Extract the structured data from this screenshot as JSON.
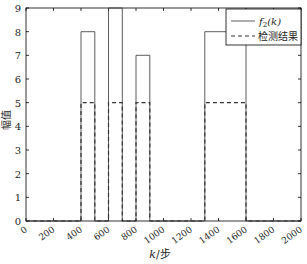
{
  "chart_data": {
    "type": "line",
    "title": "",
    "xlabel": "k/步",
    "ylabel": "幅值",
    "xlim": [
      0,
      2000
    ],
    "ylim": [
      0,
      9
    ],
    "xticks": [
      0,
      200,
      400,
      600,
      800,
      1000,
      1200,
      1400,
      1600,
      1800,
      2000
    ],
    "yticks": [
      0,
      1,
      2,
      3,
      4,
      5,
      6,
      7,
      8,
      9
    ],
    "grid": false,
    "legend_position": "top-right",
    "series": [
      {
        "name": "f2(k)",
        "style": "solid",
        "x": [
          0,
          400,
          400,
          500,
          500,
          600,
          600,
          700,
          700,
          800,
          800,
          900,
          900,
          1300,
          1300,
          1600,
          1600,
          2000
        ],
        "y": [
          0,
          0,
          8,
          8,
          0,
          0,
          9,
          9,
          0,
          0,
          7,
          7,
          0,
          0,
          8,
          8,
          0,
          0
        ]
      },
      {
        "name": "检测结果",
        "style": "dashed",
        "x": [
          0,
          400,
          400,
          500,
          500,
          600,
          600,
          700,
          700,
          800,
          800,
          900,
          900,
          1300,
          1300,
          1600,
          1600,
          2000
        ],
        "y": [
          0,
          0,
          5,
          5,
          0,
          0,
          5,
          5,
          0,
          0,
          5,
          5,
          0,
          0,
          5,
          5,
          0,
          0
        ]
      }
    ]
  },
  "legend": {
    "solid_label_f": "f",
    "solid_label_sub": "2",
    "solid_label_rest": "(k)",
    "dashed_label": "检测结果"
  },
  "axis": {
    "xlabel_k": "k",
    "xlabel_rest": "/步",
    "ylabel": "幅值"
  }
}
